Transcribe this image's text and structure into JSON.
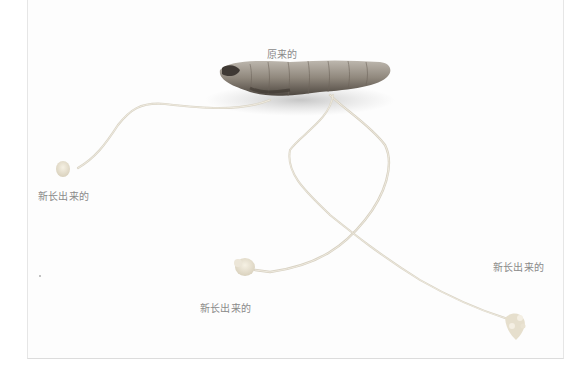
{
  "image": {
    "description": "Photo of a tuber/rhizome with thin runners ending in new shoots",
    "background_color": "#fdfdfd"
  },
  "labels": {
    "original": "原来的",
    "new_left": "新长出来的",
    "new_bottom": "新长出来的",
    "new_right": "新长出来的"
  }
}
